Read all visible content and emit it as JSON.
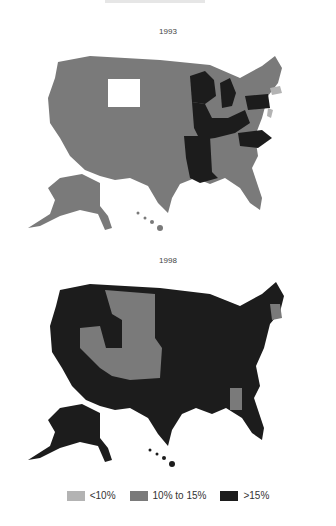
{
  "title_partial": "",
  "maps": [
    {
      "year": "1993"
    },
    {
      "year": "1998"
    }
  ],
  "colors": {
    "low": "#b3b3b3",
    "mid": "#7a7a7a",
    "high": "#1c1c1c",
    "none": "#ffffff"
  },
  "legend": [
    {
      "label": "<10%",
      "color": "#b3b3b3"
    },
    {
      "label": "10% to 15%",
      "color": "#7a7a7a"
    },
    {
      "label": ">15%",
      "color": "#1c1c1c"
    }
  ]
}
